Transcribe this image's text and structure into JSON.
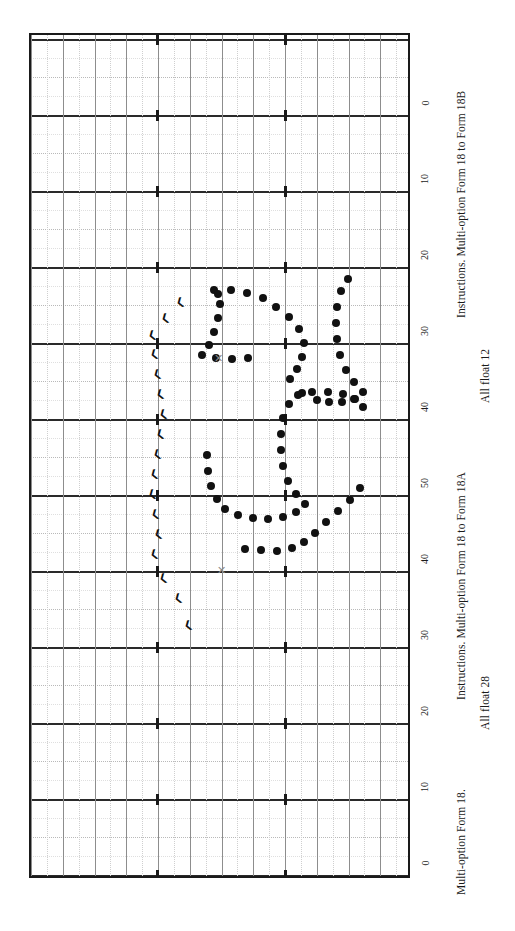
{
  "figure": {
    "background": "#ffffff",
    "frame_color": "#1a1a1a",
    "dot_color": "#111111",
    "grid_major_color": "#2a2a2a",
    "grid_minor_color": "#c9c9c9",
    "xmark_color": "#8a8a8a",
    "orientation": "rotated-90"
  },
  "axis": {
    "name": "vertical-axis-right",
    "tick_labels": [
      "0",
      "10",
      "20",
      "30",
      "40",
      "50",
      "40",
      "30",
      "20",
      "10",
      "0"
    ],
    "tick_positions_px": [
      113,
      189,
      265,
      341,
      417,
      493,
      569,
      645,
      721,
      797,
      873
    ]
  },
  "captions": [
    {
      "id": "caption-upper-title",
      "text": "Instructions. Multi-option Form 18 to Form 18B"
    },
    {
      "id": "caption-upper-float",
      "text": "All float 12"
    },
    {
      "id": "caption-mid-title",
      "text": "Instructions. Multi-option Form 18 to Form 18A"
    },
    {
      "id": "caption-mid-float",
      "text": "All float 28"
    },
    {
      "id": "caption-lower-title",
      "text": "Multi-option Form 18."
    },
    {
      "id": "caption-lower-sub",
      "text": "Multi-option Form 18 to Form 18B"
    }
  ],
  "chart_data": {
    "type": "scatter",
    "title": "Multi-option Form 18.",
    "xlabel": "",
    "ylabel": "",
    "grid": true,
    "legend_position": "none",
    "axis_tick_labels": [
      "0",
      "10",
      "20",
      "30",
      "40",
      "50",
      "40",
      "30",
      "20",
      "10",
      "0"
    ],
    "series": [
      {
        "name": "profile-loop-upper",
        "marker": "filled-circle",
        "points": [
          [
            212,
            288
          ],
          [
            229,
            288
          ],
          [
            245,
            291
          ],
          [
            261,
            296
          ],
          [
            274,
            305
          ],
          [
            287,
            315
          ],
          [
            297,
            327
          ],
          [
            302,
            341
          ],
          [
            300,
            355
          ],
          [
            295,
            367
          ],
          [
            288,
            377
          ],
          [
            300,
            391
          ],
          [
            315,
            398
          ],
          [
            327,
            400
          ],
          [
            340,
            400
          ],
          [
            352,
            397
          ],
          [
            361,
            390
          ],
          [
            352,
            380
          ],
          [
            344,
            368
          ],
          [
            338,
            353
          ],
          [
            335,
            337
          ],
          [
            334,
            321
          ],
          [
            335,
            305
          ],
          [
            339,
            289
          ],
          [
            346,
            277
          ],
          [
            246,
            356
          ],
          [
            230,
            357
          ],
          [
            214,
            356
          ],
          [
            200,
            353
          ],
          [
            207,
            343
          ],
          [
            212,
            330
          ],
          [
            216,
            316
          ],
          [
            218,
            302
          ],
          [
            216,
            292
          ]
        ]
      },
      {
        "name": "profile-loop-lower",
        "marker": "filled-circle",
        "points": [
          [
            205,
            453
          ],
          [
            206,
            469
          ],
          [
            209,
            484
          ],
          [
            215,
            497
          ],
          [
            223,
            507
          ],
          [
            236,
            513
          ],
          [
            251,
            516
          ],
          [
            266,
            517
          ],
          [
            281,
            515
          ],
          [
            294,
            510
          ],
          [
            303,
            502
          ],
          [
            294,
            492
          ],
          [
            286,
            479
          ],
          [
            281,
            464
          ],
          [
            279,
            448
          ],
          [
            279,
            432
          ],
          [
            281,
            416
          ],
          [
            287,
            402
          ],
          [
            296,
            393
          ],
          [
            310,
            390
          ],
          [
            326,
            390
          ],
          [
            341,
            392
          ],
          [
            353,
            397
          ],
          [
            361,
            405
          ],
          [
            243,
            547
          ],
          [
            259,
            548
          ],
          [
            275,
            549
          ],
          [
            290,
            546
          ],
          [
            302,
            540
          ],
          [
            313,
            531
          ],
          [
            324,
            520
          ],
          [
            336,
            509
          ],
          [
            348,
            498
          ],
          [
            358,
            486
          ]
        ]
      },
      {
        "name": "x-markers",
        "marker": "x",
        "points": [
          [
            216,
            356
          ],
          [
            219,
            568
          ]
        ]
      },
      {
        "name": "wind-barbs",
        "marker": "barb",
        "points": [
          [
            178,
            300
          ],
          [
            163,
            316
          ],
          [
            150,
            333
          ],
          [
            152,
            352
          ],
          [
            155,
            372
          ],
          [
            158,
            392
          ],
          [
            161,
            412
          ],
          [
            158,
            432
          ],
          [
            155,
            452
          ],
          [
            152,
            472
          ],
          [
            150,
            492
          ],
          [
            153,
            512
          ],
          [
            156,
            532
          ],
          [
            152,
            552
          ],
          [
            161,
            576
          ],
          [
            176,
            596
          ],
          [
            186,
            623
          ]
        ]
      }
    ]
  }
}
